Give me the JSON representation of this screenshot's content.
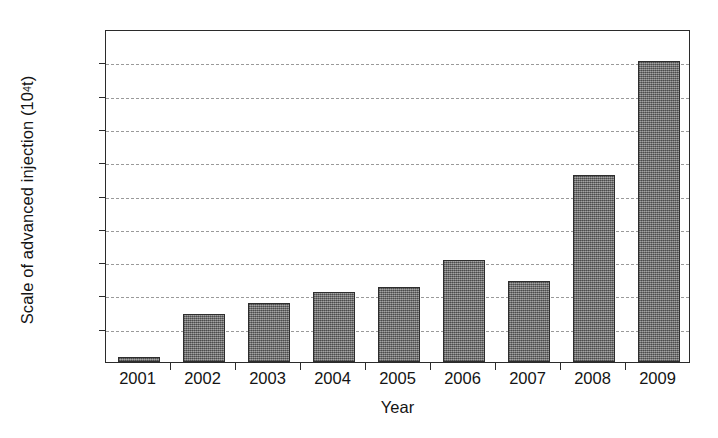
{
  "chart_data": {
    "type": "bar",
    "title": "",
    "subtitle": "",
    "xlabel": "Year",
    "ylabel_text": "Scale of advanced injection (10",
    "ylabel_sup": "4",
    "ylabel_tail": "t)",
    "ylabel_full": "Scale of advanced injection (10^4 t)",
    "categories": [
      "2001",
      "2002",
      "2003",
      "2004",
      "2005",
      "2006",
      "2007",
      "2008",
      "2009"
    ],
    "values": [
      8,
      72,
      88,
      105,
      112,
      153,
      122,
      281,
      452
    ],
    "series": [
      {
        "name": "Scale of advanced injection",
        "values": [
          8,
          72,
          88,
          105,
          112,
          153,
          122,
          281,
          452
        ]
      }
    ],
    "ylim": [
      0,
      500
    ],
    "xlim_labels": [
      "2001",
      "2009"
    ],
    "y_ticks": [
      0,
      50,
      100,
      150,
      200,
      250,
      300,
      350,
      400,
      450,
      500
    ],
    "y_tick_labels": [
      "0",
      "50",
      "100",
      "150",
      "200",
      "250",
      "300",
      "350",
      "400",
      "450",
      "500"
    ],
    "grid": true,
    "grid_style": "dashed-horizontal",
    "legend": false,
    "legend_position": "none",
    "bar_color": "#767676",
    "bar_edge_color": "#2e2e2e",
    "bar_fill_pattern": "fine-checker-dither",
    "axis_color": "#2b2b2b",
    "grid_color": "#9a9a9a",
    "background_color": "#ffffff",
    "annotations": []
  }
}
